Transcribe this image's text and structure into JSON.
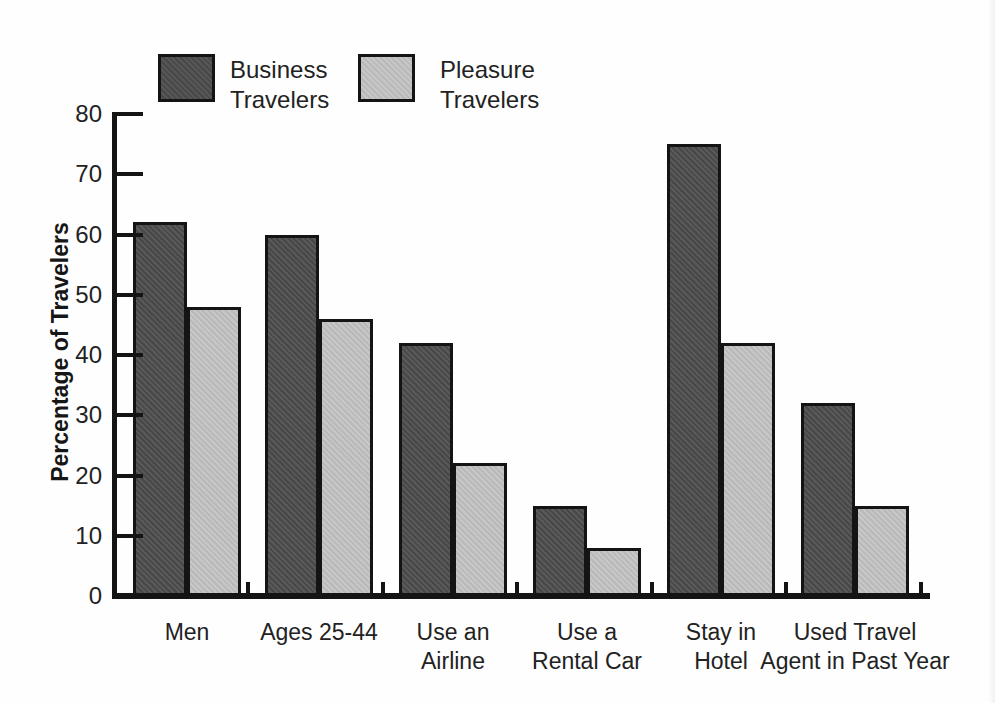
{
  "colors": {
    "axis": "#141414",
    "text": "#1c1c1c",
    "background": "#ffffff",
    "business_fill": "#4c4c4c",
    "pleasure_fill": "#c3c3c3"
  },
  "legend": {
    "business_label": "Business\nTravelers",
    "pleasure_label": "Pleasure\nTravelers"
  },
  "chart_data": {
    "type": "bar",
    "title": "",
    "xlabel": "",
    "ylabel": "Percentage of Travelers",
    "ylim": [
      0,
      80
    ],
    "ytick_step": 10,
    "yticks": [
      0,
      10,
      20,
      30,
      40,
      50,
      60,
      70,
      80
    ],
    "grid": false,
    "legend_position": "top",
    "categories": [
      "Men",
      "Ages 25-44",
      "Use an\nAirline",
      "Use a\nRental Car",
      "Stay in\nHotel",
      "Used Travel\nAgent in Past Year"
    ],
    "series": [
      {
        "name": "Business\nTravelers",
        "color": "#4c4c4c",
        "values": [
          62,
          60,
          42,
          15,
          75,
          32
        ]
      },
      {
        "name": "Pleasure\nTravelers",
        "color": "#c3c3c3",
        "values": [
          48,
          46,
          22,
          8,
          42,
          15
        ]
      }
    ]
  }
}
